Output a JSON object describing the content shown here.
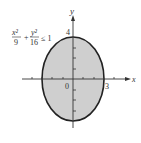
{
  "figure": {
    "inequality": {
      "x_num": "x²",
      "x_den": "9",
      "plus": "+",
      "y_num": "y²",
      "y_den": "16",
      "rel": "≤ 1"
    },
    "axis_labels": {
      "x": "x",
      "y": "y"
    },
    "tick_labels": {
      "origin": "0",
      "x_right": "3",
      "y_top": "4"
    },
    "colors": {
      "fill": "#cfcfcf",
      "stroke": "#222222",
      "axis": "#333333"
    }
  }
}
